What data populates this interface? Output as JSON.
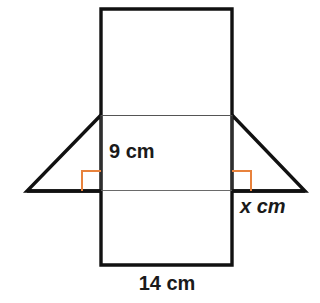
{
  "diagram": {
    "background_color": "#ffffff",
    "stroke_colors": {
      "outer_outline": "#111111",
      "inner_fold_line": "#3a3a3a",
      "right_angle_marker": "#e8823c"
    },
    "shapes": {
      "top_rectangle": {
        "name": "top-rectangle",
        "x": 101,
        "y": 9,
        "width": 131,
        "height": 106
      },
      "middle_rectangle": {
        "name": "middle-rectangle",
        "x": 101,
        "y": 115,
        "width": 131,
        "height": 76
      },
      "bottom_rectangle": {
        "name": "bottom-rectangle",
        "x": 101,
        "y": 191,
        "width": 131,
        "height": 74
      },
      "left_triangle": {
        "name": "left-triangle",
        "points": "101,115 101,191 27,191"
      },
      "right_triangle": {
        "name": "right-triangle",
        "points": "232,115 232,191 305,191"
      }
    },
    "right_angle_markers": [
      {
        "name": "right-angle-marker-left",
        "x": 82,
        "y": 171,
        "size": 19
      },
      {
        "name": "right-angle-marker-right",
        "x": 232,
        "y": 171,
        "size": 19
      }
    ],
    "labels": {
      "height": {
        "text": "9 cm",
        "value": "9",
        "unit": "cm",
        "x": 109,
        "y": 158
      },
      "slant": {
        "text": "x cm",
        "value": "x",
        "unit": "cm",
        "italic_part": "x",
        "x": 240,
        "y": 213
      },
      "base": {
        "text": "14 cm",
        "value": "14",
        "unit": "cm",
        "x": 167,
        "y": 289
      }
    }
  }
}
